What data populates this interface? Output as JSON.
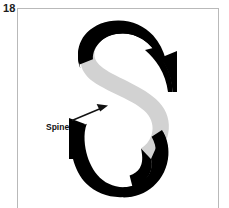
{
  "figure": {
    "number": "18",
    "caption_label": "Spine",
    "subject_letter": "S",
    "subject_description": "serif capital letter S with the spine stroke highlighted"
  },
  "frame": {
    "border_color": "#b9b9b9",
    "background_color": "#ffffff"
  },
  "annotation": {
    "label": "Spine",
    "label_color": "#111111",
    "arrow_color": "#111111",
    "arrow_from": "72,119",
    "arrow_to": "107,105"
  },
  "letter": {
    "glyph": "S",
    "stroke_color": "#000000",
    "highlight_color": "#d2d2d2",
    "highlight_part": "spine",
    "terminal_parts": [
      "top-terminal",
      "top-right-beak",
      "bottom-left-beak",
      "bottom-terminal"
    ]
  }
}
